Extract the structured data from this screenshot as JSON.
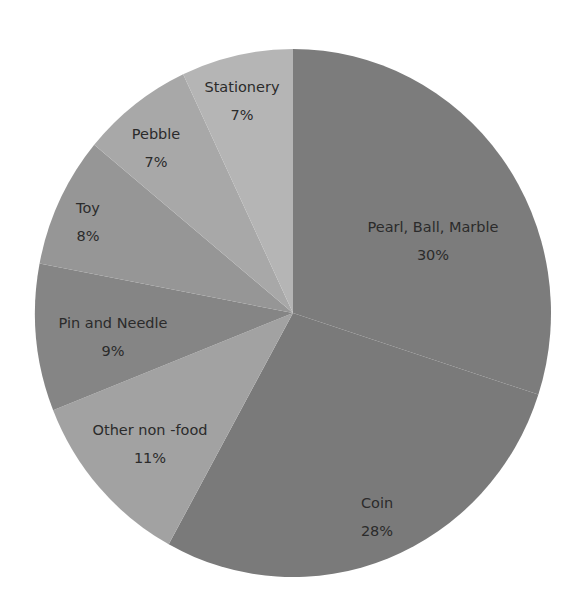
{
  "chart_data": {
    "type": "pie",
    "title": "",
    "start_angle_deg": 0,
    "direction": "clockwise",
    "legend": "none (data labels on slices)",
    "categories": [
      "Pearl, Ball, Marble",
      "Coin",
      "Other non -food",
      "Pin and Needle",
      "Toy",
      "Pebble",
      "Stationery"
    ],
    "values": [
      30,
      28,
      11,
      9,
      8,
      7,
      7
    ],
    "value_labels": [
      "30%",
      "28%",
      "11%",
      "9%",
      "8%",
      "7%",
      "7%"
    ],
    "colors": [
      "#7c7c7c",
      "#7a7a7a",
      "#a2a2a2",
      "#858585",
      "#969696",
      "#a8a8a8",
      "#b5b5b5"
    ]
  },
  "labels": [
    {
      "name": "Pearl, Ball, Marble",
      "pct": "30%",
      "x": 433,
      "y": 232
    },
    {
      "name": "Coin",
      "pct": "28%",
      "x": 377,
      "y": 508
    },
    {
      "name": "Other non -food",
      "pct": "11%",
      "x": 150,
      "y": 435
    },
    {
      "name": "Pin and Needle",
      "pct": "9%",
      "x": 113,
      "y": 328
    },
    {
      "name": "Toy",
      "pct": "8%",
      "x": 88,
      "y": 213
    },
    {
      "name": "Pebble",
      "pct": "7%",
      "x": 156,
      "y": 139
    },
    {
      "name": "Stationery",
      "pct": "7%",
      "x": 242,
      "y": 92
    }
  ]
}
